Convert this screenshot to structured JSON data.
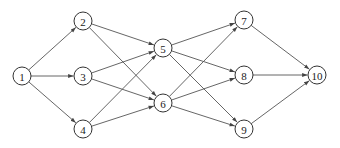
{
  "diagram": {
    "type": "directed-network",
    "nodes": [
      {
        "id": "1",
        "label": "1",
        "x": 22,
        "y": 76
      },
      {
        "id": "2",
        "label": "2",
        "x": 83,
        "y": 21
      },
      {
        "id": "3",
        "label": "3",
        "x": 83,
        "y": 76
      },
      {
        "id": "4",
        "label": "4",
        "x": 83,
        "y": 129
      },
      {
        "id": "5",
        "label": "5",
        "x": 163,
        "y": 48
      },
      {
        "id": "6",
        "label": "6",
        "x": 163,
        "y": 103
      },
      {
        "id": "7",
        "label": "7",
        "x": 244,
        "y": 20
      },
      {
        "id": "8",
        "label": "8",
        "x": 244,
        "y": 75
      },
      {
        "id": "9",
        "label": "9",
        "x": 244,
        "y": 129
      },
      {
        "id": "10",
        "label": "10",
        "x": 317,
        "y": 75
      }
    ],
    "edges": [
      [
        "1",
        "2"
      ],
      [
        "1",
        "3"
      ],
      [
        "1",
        "4"
      ],
      [
        "2",
        "5"
      ],
      [
        "2",
        "6"
      ],
      [
        "3",
        "5"
      ],
      [
        "3",
        "6"
      ],
      [
        "4",
        "5"
      ],
      [
        "4",
        "6"
      ],
      [
        "5",
        "7"
      ],
      [
        "5",
        "8"
      ],
      [
        "5",
        "9"
      ],
      [
        "6",
        "7"
      ],
      [
        "6",
        "8"
      ],
      [
        "6",
        "9"
      ],
      [
        "7",
        "10"
      ],
      [
        "8",
        "10"
      ],
      [
        "9",
        "10"
      ]
    ],
    "colors": {
      "edge": "#555555",
      "node_stroke": "#333333",
      "text": "#222222"
    }
  }
}
